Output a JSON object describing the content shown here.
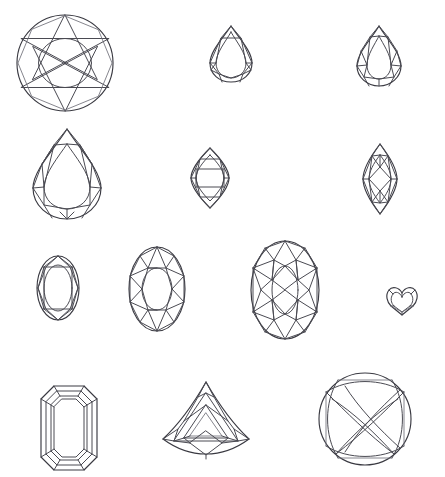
{
  "page": {
    "background_color": "#ffffff",
    "line_color": "#4a4a52",
    "outline_color": "#3a3a42",
    "width": 445,
    "height": 477,
    "watermark_text": ""
  },
  "grid": {
    "rows": 4,
    "columns": 4,
    "note": "Line-art diagrams of faceted gemstone cuts, plan view"
  },
  "gems": [
    {
      "id": "round-brilliant",
      "label": "Round Brilliant",
      "row": 1,
      "column": 1,
      "x": 16,
      "y": 13,
      "width": 98,
      "height": 100,
      "outline": "circle",
      "facet_style": "star-brilliant"
    },
    {
      "id": "pear-small",
      "label": "Pear",
      "row": 1,
      "column": 2,
      "x": 209,
      "y": 25,
      "width": 44,
      "height": 58,
      "outline": "pear",
      "facet_style": "simple-brilliant"
    },
    {
      "id": "pear-medium",
      "label": "Pear Modified",
      "row": 1,
      "column": 3,
      "x": 356,
      "y": 25,
      "width": 46,
      "height": 62,
      "outline": "pear",
      "facet_style": "full-brilliant"
    },
    {
      "id": "pear-large",
      "label": "Pear Large",
      "row": 2,
      "column": 1,
      "x": 32,
      "y": 128,
      "width": 70,
      "height": 92,
      "outline": "pear",
      "facet_style": "full-brilliant"
    },
    {
      "id": "marquise-wide",
      "label": "Marquise",
      "row": 2,
      "column": 2,
      "x": 190,
      "y": 147,
      "width": 40,
      "height": 62,
      "outline": "marquise",
      "facet_style": "step-brilliant"
    },
    {
      "id": "marquise-narrow",
      "label": "Marquise Narrow",
      "row": 2,
      "column": 3,
      "x": 362,
      "y": 143,
      "width": 36,
      "height": 72,
      "outline": "marquise",
      "facet_style": "full-brilliant"
    },
    {
      "id": "oval-small",
      "label": "Oval",
      "row": 3,
      "column": 1,
      "x": 36,
      "y": 255,
      "width": 44,
      "height": 66,
      "outline": "oval",
      "facet_style": "simple-brilliant"
    },
    {
      "id": "oval-medium",
      "label": "Oval Brilliant",
      "row": 3,
      "column": 2,
      "x": 128,
      "y": 246,
      "width": 58,
      "height": 86,
      "outline": "oval",
      "facet_style": "full-brilliant"
    },
    {
      "id": "oval-large",
      "label": "Oval Large",
      "row": 3,
      "column": 3,
      "x": 250,
      "y": 240,
      "width": 70,
      "height": 100,
      "outline": "oval",
      "facet_style": "crossed-brilliant"
    },
    {
      "id": "heart",
      "label": "Heart",
      "row": 3,
      "column": 4,
      "x": 385,
      "y": 286,
      "width": 34,
      "height": 30,
      "outline": "heart",
      "facet_style": "simple-brilliant"
    },
    {
      "id": "emerald-cut",
      "label": "Emerald Cut",
      "row": 4,
      "column": 1,
      "x": 40,
      "y": 385,
      "width": 58,
      "height": 86,
      "outline": "octagon",
      "facet_style": "step-cut"
    },
    {
      "id": "trillion",
      "label": "Trillion",
      "row": 4,
      "column": 2,
      "x": 160,
      "y": 381,
      "width": 92,
      "height": 80,
      "outline": "triangle-rounded",
      "facet_style": "trillion-brilliant"
    },
    {
      "id": "cushion-round",
      "label": "Round Cushion",
      "row": 4,
      "column": 3,
      "x": 318,
      "y": 372,
      "width": 94,
      "height": 94,
      "outline": "circle",
      "facet_style": "crosshatch-brilliant"
    }
  ]
}
